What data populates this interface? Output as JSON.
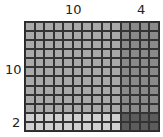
{
  "diagram": {
    "type": "area-model-multiplication",
    "top_labels": [
      {
        "text": "10",
        "columns": 10
      },
      {
        "text": "4",
        "columns": 4
      }
    ],
    "left_labels": [
      {
        "text": "10",
        "rows": 10
      },
      {
        "text": "2",
        "rows": 2
      }
    ],
    "total_columns": 14,
    "total_rows": 12,
    "regions": [
      {
        "name": "10x10",
        "rows": 10,
        "cols": 10,
        "color": "#a9a9a9"
      },
      {
        "name": "10x4",
        "rows": 10,
        "cols": 4,
        "color": "#8a8a8a"
      },
      {
        "name": "2x10",
        "rows": 2,
        "cols": 10,
        "color": "#d0d0d0"
      },
      {
        "name": "2x4",
        "rows": 2,
        "cols": 4,
        "color": "#5c5c5c"
      }
    ],
    "grid_line_color": "#333333"
  }
}
